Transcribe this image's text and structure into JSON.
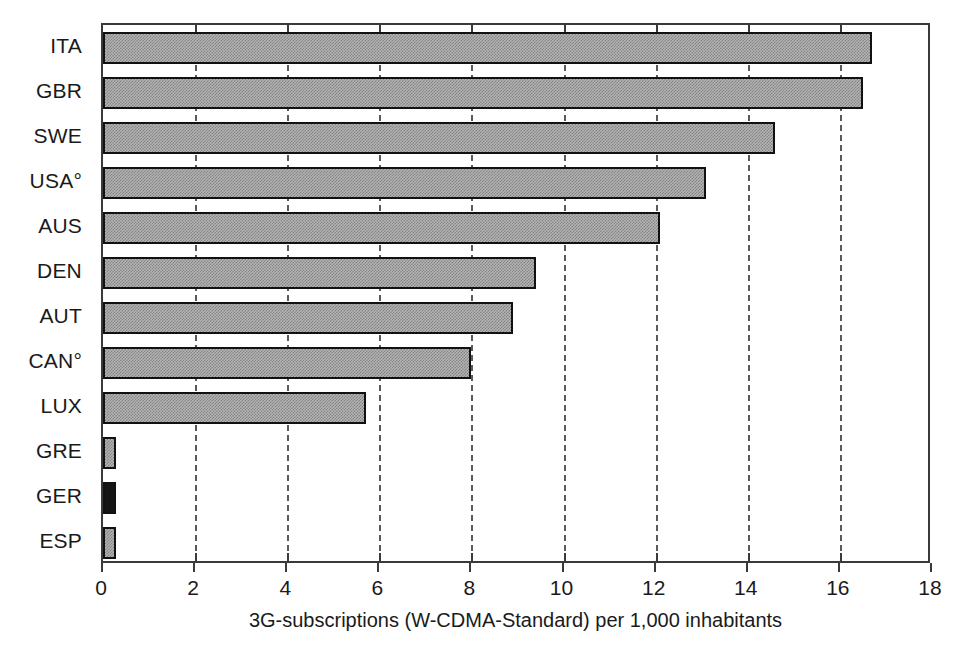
{
  "chart_data": {
    "type": "bar",
    "orientation": "horizontal",
    "title": "",
    "subtitle": "",
    "xlabel": "3G-subscriptions (W-CDMA-Standard) per 1,000 inhabitants",
    "ylabel": "",
    "xlim": [
      0,
      18
    ],
    "ylim": null,
    "grid": true,
    "grid_axis": "x",
    "grid_style": "dashed",
    "legend": false,
    "legend_position": "none",
    "xticks": [
      0,
      2,
      4,
      6,
      8,
      10,
      12,
      14,
      16,
      18
    ],
    "xticklabels": [
      "0",
      "2",
      "4",
      "6",
      "8",
      "10",
      "12",
      "14",
      "16",
      "18"
    ],
    "categories": [
      "ITA",
      "GBR",
      "SWE",
      "USA°",
      "AUS",
      "DEN",
      "AUT",
      "CAN°",
      "LUX",
      "GRE",
      "GER",
      "ESP"
    ],
    "values": [
      16.7,
      16.5,
      14.6,
      13.1,
      12.1,
      9.4,
      8.9,
      8.0,
      5.7,
      0.2,
      0.26,
      0.2
    ],
    "bar_fills": [
      "hatched",
      "hatched",
      "hatched",
      "hatched",
      "hatched",
      "hatched",
      "hatched",
      "hatched",
      "hatched",
      "hatched",
      "solid",
      "hatched"
    ],
    "bars": [
      {
        "category": "ITA",
        "value": 16.7,
        "fill": "hatched"
      },
      {
        "category": "GBR",
        "value": 16.5,
        "fill": "hatched"
      },
      {
        "category": "SWE",
        "value": 14.6,
        "fill": "hatched"
      },
      {
        "category": "USA°",
        "value": 13.1,
        "fill": "hatched"
      },
      {
        "category": "AUS",
        "value": 12.1,
        "fill": "hatched"
      },
      {
        "category": "DEN",
        "value": 9.4,
        "fill": "hatched"
      },
      {
        "category": "AUT",
        "value": 8.9,
        "fill": "hatched"
      },
      {
        "category": "CAN°",
        "value": 8.0,
        "fill": "hatched"
      },
      {
        "category": "LUX",
        "value": 5.7,
        "fill": "hatched"
      },
      {
        "category": "GRE",
        "value": 0.2,
        "fill": "hatched"
      },
      {
        "category": "GER",
        "value": 0.26,
        "fill": "solid"
      },
      {
        "category": "ESP",
        "value": 0.2,
        "fill": "hatched"
      }
    ],
    "colors": {
      "bar_hatched_base": "#b4b4b4",
      "bar_hatched_dots": "#828282",
      "bar_solid": "#151515",
      "bar_border": "#111111",
      "axis": "#3a3a3a",
      "gridline": "#5a5a5a",
      "text": "#1a1a1a",
      "background": "#ffffff"
    }
  }
}
